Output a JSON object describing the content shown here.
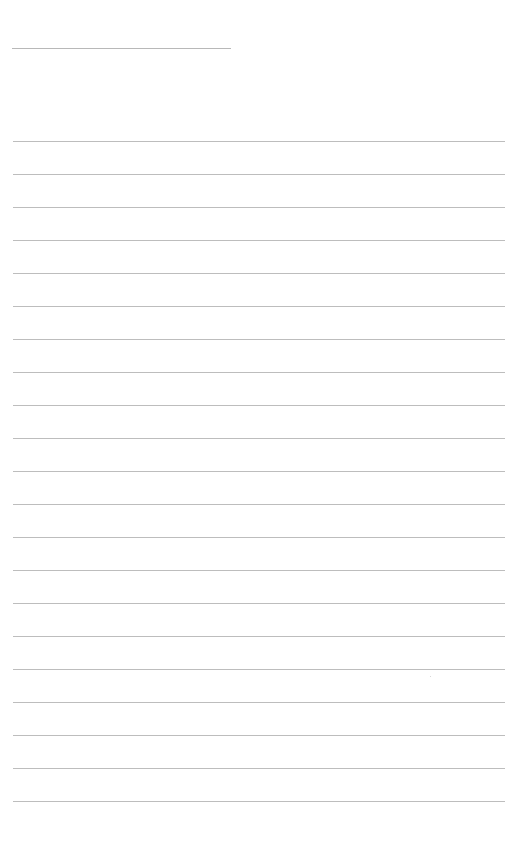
{
  "page": {
    "type": "blank lined paper",
    "header_line": {
      "x": 12,
      "y": 48,
      "width": 219
    },
    "rules": {
      "count": 21,
      "first_y": 141,
      "spacing": 33,
      "x": 13,
      "width": 492
    },
    "colors": {
      "background": "#ffffff",
      "rule": "#bdbdbd",
      "header_line": "#b8b8b8"
    }
  }
}
